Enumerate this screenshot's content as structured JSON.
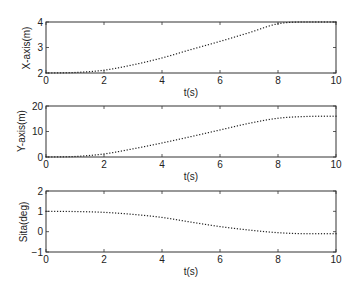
{
  "chart_data": [
    {
      "type": "scatter",
      "style": "dotted-line",
      "title": "",
      "xlabel": "t(s)",
      "ylabel": "X-axis(m)",
      "xlim": [
        0,
        10
      ],
      "ylim": [
        2,
        4
      ],
      "xticks": [
        0,
        2,
        4,
        6,
        8,
        10
      ],
      "yticks": [
        2,
        3,
        4
      ],
      "grid": false,
      "x": [
        0,
        1,
        2,
        3,
        4,
        5,
        6,
        7,
        8,
        9,
        10
      ],
      "series": [
        {
          "name": "X-axis(m)",
          "values": [
            2.0,
            2.02,
            2.11,
            2.32,
            2.59,
            2.92,
            3.24,
            3.58,
            3.93,
            4.0,
            4.0
          ]
        }
      ]
    },
    {
      "type": "scatter",
      "style": "dotted-line",
      "title": "",
      "xlabel": "t(s)",
      "ylabel": "Y-axis(m)",
      "xlim": [
        0,
        10
      ],
      "ylim": [
        0,
        20
      ],
      "xticks": [
        0,
        2,
        4,
        6,
        8,
        10
      ],
      "yticks": [
        0,
        10,
        20
      ],
      "grid": false,
      "x": [
        0,
        1,
        2,
        3,
        4,
        5,
        6,
        7,
        8,
        9,
        10
      ],
      "series": [
        {
          "name": "Y-axis(m)",
          "values": [
            0.0,
            0.2,
            1.2,
            3.2,
            5.5,
            8.0,
            10.6,
            13.2,
            15.2,
            15.9,
            16.0
          ]
        }
      ]
    },
    {
      "type": "scatter",
      "style": "dotted-line",
      "title": "",
      "xlabel": "t(s)",
      "ylabel": "Sita(deg)",
      "xlim": [
        0,
        10
      ],
      "ylim": [
        -1,
        2
      ],
      "xticks": [
        0,
        2,
        4,
        6,
        8,
        10
      ],
      "yticks": [
        -1,
        0,
        1,
        2
      ],
      "grid": false,
      "x": [
        0,
        1,
        2,
        3,
        4,
        5,
        6,
        7,
        8,
        9,
        10
      ],
      "series": [
        {
          "name": "Sita(deg)",
          "values": [
            1.0,
            0.99,
            0.95,
            0.85,
            0.7,
            0.47,
            0.25,
            0.08,
            -0.05,
            -0.1,
            -0.1
          ]
        }
      ]
    }
  ],
  "panels": [
    {
      "ylabel": "X-axis(m)",
      "xlabel": "t(s)",
      "yticks": [
        "2",
        "3",
        "4"
      ],
      "xticks": [
        "0",
        "2",
        "4",
        "6",
        "8",
        "10"
      ]
    },
    {
      "ylabel": "Y-axis(m)",
      "xlabel": "t(s)",
      "yticks": [
        "0",
        "10",
        "20"
      ],
      "xticks": [
        "0",
        "2",
        "4",
        "6",
        "8",
        "10"
      ]
    },
    {
      "ylabel": "Sita(deg)",
      "xlabel": "t(s)",
      "yticks": [
        "-1",
        "0",
        "1",
        "2"
      ],
      "xticks": [
        "0",
        "2",
        "4",
        "6",
        "8",
        "10"
      ]
    }
  ],
  "colors": {
    "axis": "#333333",
    "line": "#222222",
    "background": "#ffffff"
  }
}
